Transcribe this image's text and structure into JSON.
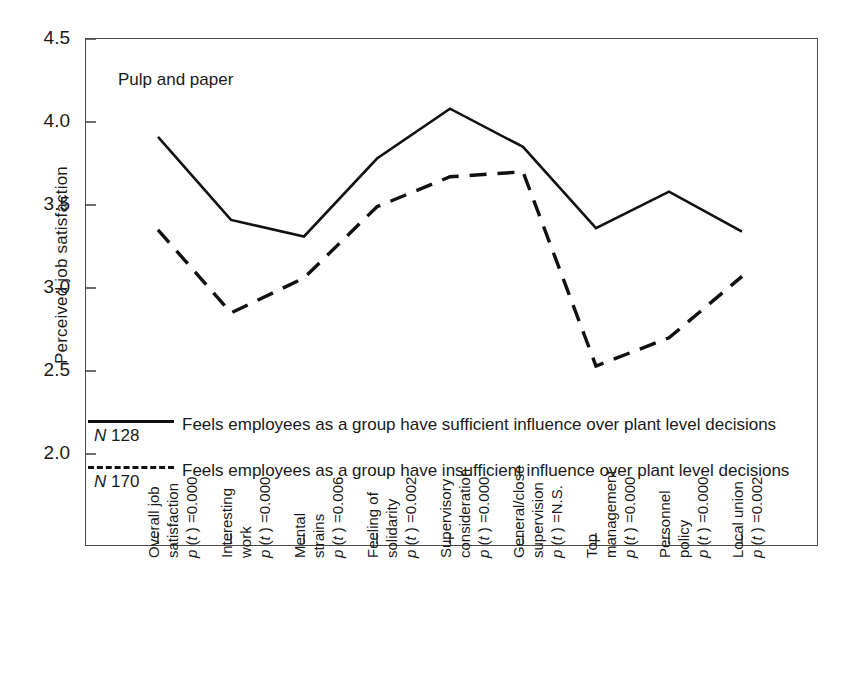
{
  "figure": {
    "annotation": "Pulp and paper",
    "y_axis_title": "Perceived job satisfaction",
    "y_ticks": [
      "4.5",
      "4.0",
      "3.5",
      "3.0",
      "2.5",
      "2.0"
    ]
  },
  "legend": {
    "entries": [
      {
        "n_label": "N =128",
        "style": "solid",
        "line1": "Feels employees as a group have sufficient influence",
        "line2": "over plant level decisions"
      },
      {
        "n_label": "N =170",
        "style": "dashed",
        "line1": "Feels employees as a group have  insufficient influence",
        "line2": "over plant level decisions"
      }
    ]
  },
  "x_axis": {
    "labels": [
      {
        "name_line1": "Overall job",
        "name_line2": "satisfaction",
        "pvalue": "p (t ) =0.000"
      },
      {
        "name_line1": "Interesting",
        "name_line2": "work",
        "pvalue": "p (t ) =0.000"
      },
      {
        "name_line1": "Mental",
        "name_line2": "strains",
        "pvalue": "p (t ) =0.006"
      },
      {
        "name_line1": "Feeling of",
        "name_line2": "solidarity",
        "pvalue": "p (t ) =0.002"
      },
      {
        "name_line1": "Supervisory",
        "name_line2": "consideration",
        "pvalue": "p (t ) =0.000"
      },
      {
        "name_line1": "General/close",
        "name_line2": "supervision",
        "pvalue": "p (t ) =N.S."
      },
      {
        "name_line1": "Top",
        "name_line2": "management",
        "pvalue": "p (t ) =0.000"
      },
      {
        "name_line1": "Personnel",
        "name_line2": "policy",
        "pvalue": "p (t ) =0.000"
      },
      {
        "name_line1": "Local union",
        "name_line2": "",
        "pvalue": "p (t ) =0.002"
      }
    ]
  },
  "chart_data": {
    "type": "line",
    "title": "Pulp and paper",
    "xlabel": "",
    "ylabel": "Perceived job satisfaction",
    "ylim": [
      2.0,
      4.5
    ],
    "grid": false,
    "legend_position": "inside-bottom-left",
    "categories": [
      "Overall job satisfaction",
      "Interesting work",
      "Mental strains",
      "Feeling of solidarity",
      "Supervisory consideration",
      "General/close supervision",
      "Top management",
      "Personnel policy",
      "Local union"
    ],
    "p_values": [
      "0.000",
      "0.000",
      "0.006",
      "0.002",
      "0.000",
      "N.S.",
      "0.000",
      "0.000",
      "0.002"
    ],
    "series": [
      {
        "name": "Feels employees as a group have sufficient influence over plant level decisions",
        "n": 128,
        "style": "solid",
        "color": "#111111",
        "values": [
          3.91,
          3.41,
          3.31,
          3.78,
          4.08,
          3.85,
          3.36,
          3.58,
          3.34
        ]
      },
      {
        "name": "Feels employees as a group have insufficient influence over plant level decisions",
        "n": 170,
        "style": "dashed",
        "color": "#111111",
        "values": [
          3.35,
          2.85,
          3.06,
          3.49,
          3.67,
          3.7,
          2.53,
          2.7,
          3.07
        ]
      }
    ]
  }
}
